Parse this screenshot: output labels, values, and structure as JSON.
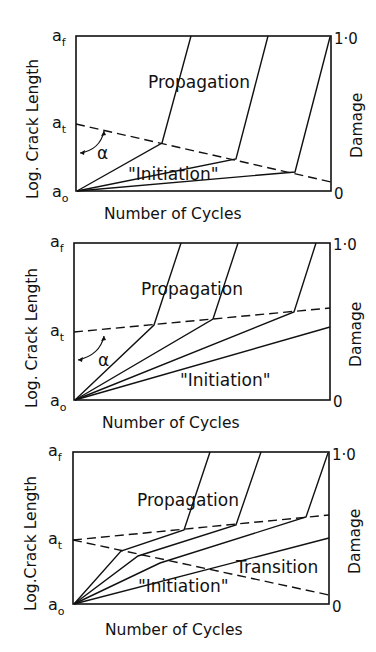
{
  "figure": {
    "panels": [
      {
        "id": "panel-1",
        "y_axis_left_label": "Log. Crack Length",
        "y_axis_right_label": "Damage",
        "x_axis_label": "Number of Cycles",
        "left_ticks": {
          "top": "a",
          "top_sub": "f",
          "mid": "a",
          "mid_sub": "t",
          "bottom": "a",
          "bottom_sub": "o"
        },
        "right_ticks": {
          "top": "1·0",
          "bottom": "0"
        },
        "region_labels": {
          "upper": "Propagation",
          "lower": "\"Initiation\""
        },
        "angle_label": "α",
        "transition_line": "decreasing"
      },
      {
        "id": "panel-2",
        "y_axis_left_label": "Log. Crack Length",
        "y_axis_right_label": "Damage",
        "x_axis_label": "Number of Cycles",
        "left_ticks": {
          "top": "a",
          "top_sub": "f",
          "mid": "a",
          "mid_sub": "t",
          "bottom": "a",
          "bottom_sub": "o"
        },
        "right_ticks": {
          "top": "1·0",
          "bottom": "0"
        },
        "region_labels": {
          "upper": "Propagation",
          "lower": "\"Initiation\""
        },
        "angle_label": "α",
        "transition_line": "increasing"
      },
      {
        "id": "panel-3",
        "y_axis_left_label": "Log.Crack Length",
        "y_axis_right_label": "Damage",
        "x_axis_label": "Number of Cycles",
        "left_ticks": {
          "top": "a",
          "top_sub": "f",
          "mid": "a",
          "mid_sub": "t",
          "bottom": "a",
          "bottom_sub": "o"
        },
        "right_ticks": {
          "top": "1·0",
          "bottom": "0"
        },
        "region_labels": {
          "upper": "Propagation",
          "middle": "Transition",
          "lower": "\"Initiation\""
        },
        "transition_line": "increasing and decreasing"
      }
    ]
  }
}
